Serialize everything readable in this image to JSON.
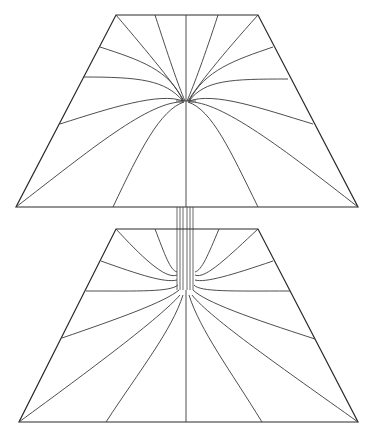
{
  "diagram": {
    "colors": {
      "background": "#ffffff",
      "line": "#2a2a2a"
    },
    "upper_panel": {
      "top_edge": [
        [
          116,
          15
        ],
        [
          258,
          15
        ]
      ],
      "bottom_edge": [
        [
          16,
          207
        ],
        [
          358,
          207
        ]
      ],
      "focus": [
        186,
        101
      ],
      "field_line_count": 17
    },
    "lower_panel": {
      "top_edge": [
        [
          116,
          229
        ],
        [
          258,
          229
        ]
      ],
      "bottom_edge": [
        [
          19,
          422
        ],
        [
          358,
          422
        ]
      ],
      "focus": [
        186,
        290
      ],
      "field_line_count": 17
    },
    "connector": {
      "x_range": [
        177,
        193
      ],
      "y_range": [
        207,
        290
      ],
      "parallel_line_count": 6
    }
  }
}
